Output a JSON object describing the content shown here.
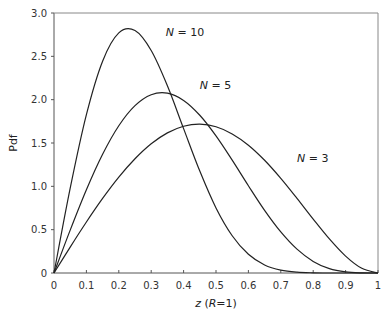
{
  "chart_data": {
    "type": "line",
    "title": "",
    "xlabel": "z (R=1)",
    "xlabel_parts": {
      "var": "z",
      "paren_open": " (",
      "param": "R",
      "rest": "=1)"
    },
    "ylabel": "Pdf",
    "xlim": [
      0,
      1
    ],
    "ylim": [
      0,
      3.0
    ],
    "grid": false,
    "legend": "inline labels",
    "x_ticks": [
      "0",
      "0.1",
      "0.2",
      "0.3",
      "0.4",
      "0.5",
      "0.6",
      "0.7",
      "0.8",
      "0.9",
      "1"
    ],
    "x_tick_values": [
      0,
      0.1,
      0.2,
      0.3,
      0.4,
      0.5,
      0.6,
      0.7,
      0.8,
      0.9,
      1.0
    ],
    "y_ticks": [
      "0",
      "0.5",
      "1.0",
      "1.5",
      "2.0",
      "2.5",
      "3.0"
    ],
    "y_tick_values": [
      0,
      0.5,
      1.0,
      1.5,
      2.0,
      2.5,
      3.0
    ],
    "x": [
      0,
      0.05,
      0.1,
      0.15,
      0.2,
      0.25,
      0.3,
      0.35,
      0.4,
      0.45,
      0.5,
      0.55,
      0.6,
      0.65,
      0.7,
      0.75,
      0.8,
      0.85,
      0.9,
      0.95,
      1.0
    ],
    "series": [
      {
        "name": "N = 3",
        "label_n": "3",
        "label_pos": [
          0.75,
          1.28
        ],
        "values": [
          0,
          0.299,
          0.588,
          0.86,
          1.106,
          1.318,
          1.491,
          1.617,
          1.693,
          1.717,
          1.688,
          1.605,
          1.475,
          1.301,
          1.092,
          0.861,
          0.622,
          0.393,
          0.195,
          0.054,
          0
        ]
      },
      {
        "name": "N = 5",
        "label_n": "5",
        "label_pos": [
          0.45,
          2.12
        ],
        "values": [
          0,
          0.495,
          0.961,
          1.37,
          1.699,
          1.931,
          2.057,
          2.075,
          1.991,
          1.82,
          1.582,
          1.302,
          1.007,
          0.723,
          0.474,
          0.275,
          0.134,
          0.05,
          0.012,
          0.001,
          0
        ]
      },
      {
        "name": "N = 10",
        "label_n": "10",
        "label_pos": [
          0.345,
          2.73
        ],
        "values": [
          0,
          0.978,
          1.827,
          2.444,
          2.77,
          2.797,
          2.567,
          2.16,
          1.666,
          1.176,
          0.751,
          0.43,
          0.216,
          0.093,
          0.033,
          0.009,
          0.002,
          0.0,
          0.0,
          0.0,
          0
        ]
      }
    ]
  },
  "colors": {
    "line": "#222222",
    "axis": "#555555",
    "frame": "#888888"
  }
}
